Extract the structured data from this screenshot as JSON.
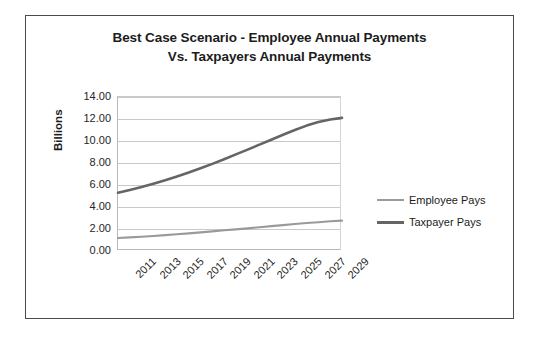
{
  "figure": {
    "border_color": "#4a4a4a",
    "background": "#ffffff"
  },
  "chart_data": {
    "type": "line",
    "title": "Best Case Scenario - Employee Annual Payments Vs. Taxpayers Annual Payments",
    "title_line1": "Best Case Scenario - Employee Annual Payments",
    "title_line2": "Vs. Taxpayers Annual Payments",
    "xlabel": "",
    "ylabel": "Billions",
    "ylim": [
      0,
      14
    ],
    "ytick_values": [
      0,
      2,
      4,
      6,
      8,
      10,
      12,
      14
    ],
    "ytick_labels": [
      "0.00",
      "2.00",
      "4.00",
      "6.00",
      "8.00",
      "10.00",
      "12.00",
      "14.00"
    ],
    "grid": true,
    "grid_axis": "y",
    "legend_position": "right",
    "x": [
      2011,
      2012,
      2013,
      2014,
      2015,
      2016,
      2017,
      2018,
      2019,
      2020,
      2021,
      2022,
      2023,
      2024,
      2025,
      2026,
      2027,
      2028,
      2029,
      2030
    ],
    "xtick_labels": [
      "2011",
      "2013",
      "2015",
      "2017",
      "2019",
      "2021",
      "2023",
      "2025",
      "2027",
      "2029"
    ],
    "xtick_values": [
      2011,
      2013,
      2015,
      2017,
      2019,
      2021,
      2023,
      2025,
      2027,
      2029
    ],
    "series": [
      {
        "name": "Employee Pays",
        "color": "#9a9a9a",
        "line_width": 2.1,
        "values": [
          1.18,
          1.24,
          1.3,
          1.37,
          1.44,
          1.52,
          1.6,
          1.69,
          1.78,
          1.88,
          1.97,
          2.06,
          2.16,
          2.26,
          2.35,
          2.45,
          2.54,
          2.62,
          2.7,
          2.76
        ]
      },
      {
        "name": "Taxpayer Pays",
        "color": "#656565",
        "line_width": 2.6,
        "values": [
          5.3,
          5.55,
          5.82,
          6.12,
          6.44,
          6.78,
          7.14,
          7.52,
          7.92,
          8.34,
          8.78,
          9.22,
          9.67,
          10.12,
          10.57,
          11.0,
          11.4,
          11.72,
          11.96,
          12.1
        ]
      }
    ]
  },
  "legend": {
    "items": [
      {
        "label": "Employee Pays",
        "color": "#9a9a9a",
        "thickness": 2.2
      },
      {
        "label": "Taxpayer Pays",
        "color": "#656565",
        "thickness": 3.0
      }
    ]
  }
}
